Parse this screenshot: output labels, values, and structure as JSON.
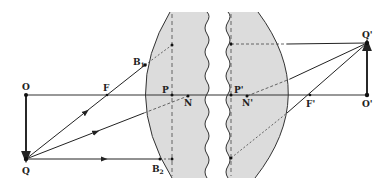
{
  "diagram": {
    "type": "optics-ray-diagram",
    "colors": {
      "lens_fill": "#dcdcdc",
      "line": "#222222",
      "background": "#ffffff"
    },
    "labels": {
      "object_top": "O",
      "object_bottom": "Q",
      "focal_front": "F",
      "focal_back": "F'",
      "principal_front": "P",
      "principal_back": "P'",
      "nodal_front": "N",
      "nodal_back": "N'",
      "image_base": "O'",
      "image_tip": "Q'",
      "surface_point_1": "B",
      "surface_point_1_sub": "1",
      "surface_point_2": "B",
      "surface_point_2_sub": "2"
    }
  }
}
